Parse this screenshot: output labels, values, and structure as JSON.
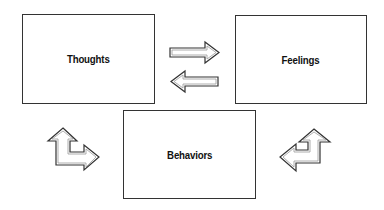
{
  "diagram": {
    "title": "",
    "nodes": [
      {
        "id": "thoughts",
        "label": "Thoughts"
      },
      {
        "id": "feelings",
        "label": "Feelings"
      },
      {
        "id": "behaviors",
        "label": "Behaviors"
      }
    ],
    "edges": [
      {
        "from": "thoughts",
        "to": "feelings",
        "style": "outlined-arrow"
      },
      {
        "from": "feelings",
        "to": "thoughts",
        "style": "outlined-arrow"
      },
      {
        "from": "thoughts",
        "to": "behaviors",
        "style": "bidirectional-bent-arrow"
      },
      {
        "from": "feelings",
        "to": "behaviors",
        "style": "bidirectional-bent-arrow"
      }
    ],
    "colors": {
      "stroke": "#333333",
      "arrow_fill": "#ffffff",
      "arrow_inner": "#9a9a9a",
      "background": "#ffffff"
    }
  }
}
